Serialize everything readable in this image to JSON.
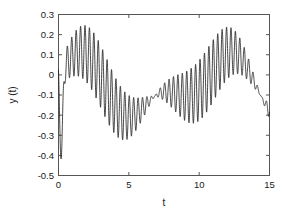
{
  "chart_data": {
    "type": "line",
    "title": "",
    "xlabel": "t",
    "ylabel": "y (t)",
    "xlim": [
      0,
      15
    ],
    "ylim": [
      -0.5,
      0.3
    ],
    "xticks": [
      0,
      5,
      10,
      15
    ],
    "xtick_labels": [
      "0",
      "5",
      "10",
      "15"
    ],
    "yticks": [
      -0.5,
      -0.4,
      -0.3,
      -0.2,
      -0.1,
      0,
      0.1,
      0.2,
      0.3
    ],
    "ytick_labels": [
      "-0.5",
      "-0.4",
      "-0.3",
      "-0.2",
      "-0.1",
      "0",
      "0.1",
      "0.2",
      "0.3"
    ],
    "grid": false,
    "legend": null,
    "series": [
      {
        "name": "y(t)",
        "color": "#1a1a1a",
        "line_width": 0.8,
        "description": "Amplitude-modulated oscillation: slow envelope carrier with superposed high-frequency ripple whose amplitude collapses near t=9 and grows toward both ends",
        "model": {
          "slow_component": {
            "form": "A*sin(2*pi*f1*t + p1) + B*sin(2*pi*f2*t + p2) + C",
            "A": 0.115,
            "f1": 0.0931,
            "p1": 1.0,
            "B": 0.075,
            "f2": 0.1862,
            "p2": -0.55,
            "C": -0.065
          },
          "fast_component": {
            "form": "E(t)*sin(2*pi*f3*t + p3)",
            "f3": 3.18,
            "p3": 1.62,
            "envelope_form": "abs(G*sin(2*pi*fe*t + pe))",
            "G": 0.155,
            "fe": 0.0662,
            "pe": 0.3
          },
          "initial_transient": {
            "t_start": 0.0,
            "y_start": 0.17,
            "t_min": 0.17,
            "y_min": -0.43
          }
        },
        "key_points": [
          {
            "t": 0.0,
            "y": 0.17
          },
          {
            "t": 0.17,
            "y": -0.43
          },
          {
            "t": 0.8,
            "y": 0.15
          },
          {
            "t": 1.55,
            "y": 0.08
          },
          {
            "t": 2.3,
            "y": -0.01
          },
          {
            "t": 3.1,
            "y": -0.19
          },
          {
            "t": 3.6,
            "y": -0.31
          },
          {
            "t": 4.2,
            "y": -0.22
          },
          {
            "t": 5.1,
            "y": -0.13
          },
          {
            "t": 6.1,
            "y": 0.05
          },
          {
            "t": 6.95,
            "y": 0.145
          },
          {
            "t": 7.35,
            "y": 0.115
          },
          {
            "t": 7.55,
            "y": 0.125
          },
          {
            "t": 8.6,
            "y": 0.0
          },
          {
            "t": 9.5,
            "y": -0.1
          },
          {
            "t": 10.4,
            "y": 0.02
          },
          {
            "t": 11.05,
            "y": 0.155
          },
          {
            "t": 11.9,
            "y": 0.09
          },
          {
            "t": 12.8,
            "y": -0.05
          },
          {
            "t": 13.7,
            "y": -0.17
          },
          {
            "t": 14.5,
            "y": -0.24
          },
          {
            "t": 15.0,
            "y": -0.3
          }
        ],
        "envelope_upper": [
          {
            "t": 0.8,
            "y": 0.15
          },
          {
            "t": 1.6,
            "y": 0.085
          },
          {
            "t": 2.4,
            "y": -0.01
          },
          {
            "t": 3.2,
            "y": -0.16
          },
          {
            "t": 4.0,
            "y": -0.175
          },
          {
            "t": 4.8,
            "y": -0.155
          },
          {
            "t": 5.6,
            "y": -0.04
          },
          {
            "t": 6.4,
            "y": 0.085
          },
          {
            "t": 7.0,
            "y": 0.145
          },
          {
            "t": 9.5,
            "y": -0.1
          },
          {
            "t": 11.05,
            "y": 0.155
          },
          {
            "t": 12.0,
            "y": 0.09
          },
          {
            "t": 13.0,
            "y": -0.01
          },
          {
            "t": 14.0,
            "y": -0.115
          },
          {
            "t": 15.0,
            "y": -0.215
          }
        ],
        "envelope_lower": [
          {
            "t": 0.8,
            "y": -0.3
          },
          {
            "t": 1.6,
            "y": -0.245
          },
          {
            "t": 2.4,
            "y": -0.3
          },
          {
            "t": 3.2,
            "y": -0.315
          },
          {
            "t": 4.0,
            "y": -0.27
          },
          {
            "t": 4.8,
            "y": -0.265
          },
          {
            "t": 5.6,
            "y": -0.22
          },
          {
            "t": 6.4,
            "y": -0.095
          },
          {
            "t": 7.0,
            "y": 0.04
          },
          {
            "t": 9.5,
            "y": -0.1
          },
          {
            "t": 11.05,
            "y": 0.09
          },
          {
            "t": 12.0,
            "y": -0.06
          },
          {
            "t": 13.0,
            "y": -0.19
          },
          {
            "t": 14.0,
            "y": -0.275
          },
          {
            "t": 15.0,
            "y": -0.32
          }
        ]
      }
    ]
  },
  "figure": {
    "background": "#ffffff",
    "axis_color": "#555555",
    "text_color": "#1a1a1a"
  }
}
